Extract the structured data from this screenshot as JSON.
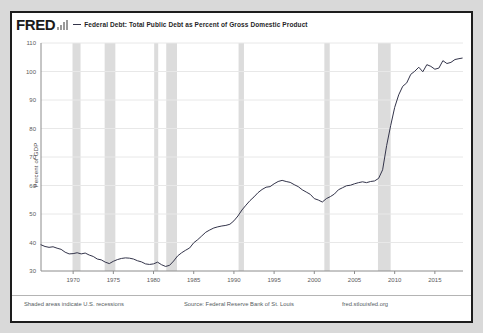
{
  "header": {
    "logo_text": "FRED",
    "logo_icon": "bar-chart-icon",
    "series_title": "Federal Debt: Total Public Debt as Percent of Gross Domestic Product"
  },
  "footer": {
    "recession_note": "Shaded areas indicate U.S. recessions",
    "source": "Source: Federal Reserve Bank of St. Louis",
    "url": "fred.stlouisfed.org"
  },
  "colors": {
    "line": "#33344a",
    "recession_band": "#dcdcdc",
    "grid": "#e8e8e8",
    "axis": "#8c8c8c",
    "frame": "#1d1d1d",
    "page_background": "#d9d9d9",
    "plot_background": "#ffffff"
  },
  "chart_data": {
    "type": "line",
    "title": "Federal Debt: Total Public Debt as Percent of Gross Domestic Product",
    "xlabel": "",
    "ylabel": "Percent of GDP",
    "ylim": [
      30,
      110
    ],
    "xlim": [
      1966,
      2018.5
    ],
    "yticks": [
      30,
      40,
      50,
      60,
      70,
      80,
      90,
      100,
      110
    ],
    "xticks": [
      1970,
      1975,
      1980,
      1985,
      1990,
      1995,
      2000,
      2005,
      2010,
      2015
    ],
    "ytick_labels": [
      "30",
      "40",
      "50",
      "60",
      "70",
      "80",
      "90",
      "100",
      "110"
    ],
    "xtick_labels": [
      "1970",
      "1975",
      "1980",
      "1985",
      "1990",
      "1995",
      "2000",
      "2005",
      "2010",
      "2015"
    ],
    "grid": true,
    "legend_position": "top",
    "series": [
      {
        "name": "Federal Debt: Total Public Debt as Percent of Gross Domestic Product",
        "color": "#33344a",
        "x": [
          1966.0,
          1966.5,
          1967.0,
          1967.5,
          1968.0,
          1968.5,
          1969.0,
          1969.5,
          1970.0,
          1970.5,
          1971.0,
          1971.5,
          1972.0,
          1972.5,
          1973.0,
          1973.5,
          1974.0,
          1974.5,
          1975.0,
          1975.5,
          1976.0,
          1976.5,
          1977.0,
          1977.5,
          1978.0,
          1978.5,
          1979.0,
          1979.5,
          1980.0,
          1980.5,
          1981.0,
          1981.5,
          1982.0,
          1982.5,
          1983.0,
          1983.5,
          1984.0,
          1984.5,
          1985.0,
          1985.5,
          1986.0,
          1986.5,
          1987.0,
          1987.5,
          1988.0,
          1988.5,
          1989.0,
          1989.5,
          1990.0,
          1990.5,
          1991.0,
          1991.5,
          1992.0,
          1992.5,
          1993.0,
          1993.5,
          1994.0,
          1994.5,
          1995.0,
          1995.5,
          1996.0,
          1996.5,
          1997.0,
          1997.5,
          1998.0,
          1998.5,
          1999.0,
          1999.5,
          2000.0,
          2000.5,
          2001.0,
          2001.5,
          2002.0,
          2002.5,
          2003.0,
          2003.5,
          2004.0,
          2004.5,
          2005.0,
          2005.5,
          2006.0,
          2006.5,
          2007.0,
          2007.5,
          2008.0,
          2008.5,
          2009.0,
          2009.5,
          2010.0,
          2010.5,
          2011.0,
          2011.5,
          2012.0,
          2012.5,
          2013.0,
          2013.5,
          2014.0,
          2014.5,
          2015.0,
          2015.5,
          2016.0,
          2016.5,
          2017.0,
          2017.5,
          2018.0,
          2018.4
        ],
        "y": [
          39.2,
          38.6,
          38.3,
          38.5,
          38.0,
          37.6,
          36.6,
          36.0,
          36.1,
          36.4,
          36.0,
          36.3,
          35.6,
          35.1,
          34.2,
          33.9,
          33.1,
          32.6,
          33.4,
          34.0,
          34.4,
          34.6,
          34.5,
          34.2,
          33.6,
          33.2,
          32.5,
          32.3,
          32.5,
          33.1,
          32.2,
          31.6,
          32.0,
          33.5,
          35.3,
          36.4,
          37.3,
          38.1,
          39.9,
          41.0,
          42.3,
          43.6,
          44.4,
          45.1,
          45.5,
          45.8,
          46.0,
          46.4,
          47.6,
          49.3,
          51.4,
          53.1,
          54.7,
          56.0,
          57.5,
          58.6,
          59.4,
          59.6,
          60.6,
          61.4,
          61.8,
          61.4,
          61.1,
          60.3,
          59.6,
          58.5,
          57.7,
          56.9,
          55.4,
          54.9,
          54.2,
          55.4,
          56.1,
          57.0,
          58.5,
          59.2,
          59.9,
          60.1,
          60.6,
          61.0,
          61.3,
          61.0,
          61.4,
          61.6,
          62.5,
          65.5,
          74.0,
          81.0,
          87.4,
          91.8,
          94.8,
          96.0,
          99.0,
          100.1,
          101.5,
          99.9,
          102.4,
          101.8,
          100.8,
          101.2,
          103.8,
          102.8,
          103.2,
          104.2,
          104.5,
          104.7
        ]
      }
    ],
    "recessions": [
      {
        "start": 1969.92,
        "end": 1970.92
      },
      {
        "start": 1973.92,
        "end": 1975.25
      },
      {
        "start": 1980.08,
        "end": 1980.58
      },
      {
        "start": 1981.58,
        "end": 1982.92
      },
      {
        "start": 1990.58,
        "end": 1991.25
      },
      {
        "start": 2001.25,
        "end": 2001.92
      },
      {
        "start": 2007.92,
        "end": 2009.5
      }
    ]
  }
}
